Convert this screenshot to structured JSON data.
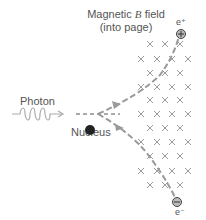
{
  "field_label": {
    "line1_prefix": "Magnetic ",
    "line1_symbol": "B",
    "line1_suffix": " field",
    "line2": "(into page)"
  },
  "photon_label": "Photon",
  "nucleus_label": "Nucleus",
  "positron_label": "e⁺",
  "electron_label": "e⁻",
  "positron_symbol": "⊕",
  "electron_symbol": "⊖",
  "field_marker": "×",
  "colors": {
    "text": "#555555",
    "track": "#9a9a9a",
    "nucleus": "#222222",
    "field_marks": "#9a9a9a"
  }
}
